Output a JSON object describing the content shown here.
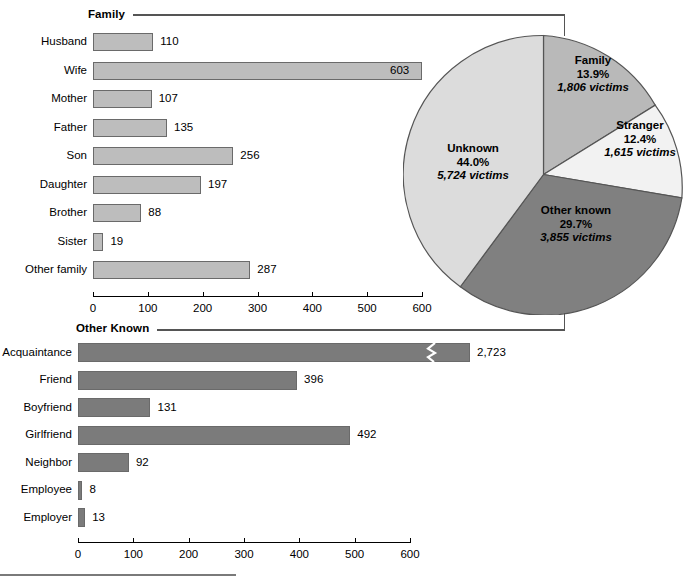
{
  "figure": {
    "footer_rule": true
  },
  "sections": {
    "family": {
      "label": "Family"
    },
    "other_known": {
      "label": "Other Known"
    }
  },
  "axis": {
    "ticks": [
      "0",
      "100",
      "200",
      "300",
      "400",
      "500",
      "600"
    ],
    "tick_values": [
      0,
      100,
      200,
      300,
      400,
      500,
      600
    ],
    "max": 600
  },
  "pie_labels": {
    "family": {
      "name": "Family",
      "pct": "13.9%",
      "victims": "1,806 victims"
    },
    "stranger": {
      "name": "Stranger",
      "pct": "12.4%",
      "victims": "1,615 victims"
    },
    "other_known": {
      "name": "Other known",
      "pct": "29.7%",
      "victims": "3,855 victims"
    },
    "unknown": {
      "name": "Unknown",
      "pct": "44.0%",
      "victims": "5,724 victims"
    }
  },
  "colors": {
    "family_slice": "#b9b9b9",
    "stranger_slice": "#f2f2f2",
    "other_known_slice": "#808080",
    "unknown_slice": "#dcdcdc",
    "bar_light": "#bdbdbd",
    "bar_dark": "#7b7b7b",
    "outline": "#555555"
  },
  "chart_data": [
    {
      "type": "pie",
      "title": "Victim–offender relationship",
      "labels": [
        "Family",
        "Stranger",
        "Other known",
        "Unknown"
      ],
      "values": [
        1806,
        1615,
        3855,
        5724
      ],
      "percentages": [
        13.9,
        12.4,
        29.7,
        44.0
      ],
      "value_labels": [
        "1,806 victims",
        "1,615 victims",
        "3,855 victims",
        "5,724 victims"
      ],
      "start_angle_deg": 0,
      "direction": "clockwise",
      "legend": "inside-slices"
    },
    {
      "type": "bar",
      "orientation": "horizontal",
      "title": "Family",
      "categories": [
        "Husband",
        "Wife",
        "Mother",
        "Father",
        "Son",
        "Daughter",
        "Brother",
        "Sister",
        "Other family"
      ],
      "values": [
        110,
        603,
        107,
        135,
        256,
        197,
        88,
        19,
        287
      ],
      "value_labels": [
        "110",
        "603",
        "107",
        "135",
        "256",
        "197",
        "88",
        "19",
        "287"
      ],
      "xlabel": "",
      "ylabel": "",
      "xlim": [
        0,
        600
      ],
      "xticks": [
        0,
        100,
        200,
        300,
        400,
        500,
        600
      ],
      "grid": false,
      "note": "Wife bar (603) exceeds axis max and its label sits inside the bar"
    },
    {
      "type": "bar",
      "orientation": "horizontal",
      "title": "Other Known",
      "categories": [
        "Acquaintance",
        "Friend",
        "Boyfriend",
        "Girlfriend",
        "Neighbor",
        "Employee",
        "Employer"
      ],
      "values": [
        2723,
        396,
        131,
        492,
        92,
        8,
        13
      ],
      "value_labels": [
        "2,723",
        "396",
        "131",
        "492",
        "92",
        "8",
        "13"
      ],
      "xlabel": "",
      "ylabel": "",
      "xlim": [
        0,
        600
      ],
      "xticks": [
        0,
        100,
        200,
        300,
        400,
        500,
        600
      ],
      "grid": false,
      "note": "Acquaintance bar (2,723) is broken with an axis-break zigzag"
    }
  ]
}
